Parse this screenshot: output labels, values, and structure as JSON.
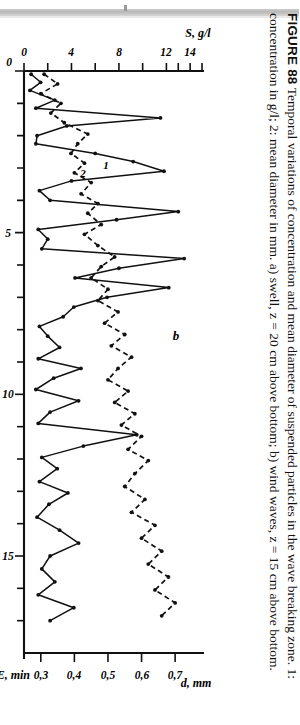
{
  "page": {
    "background": "#ffffff",
    "orientation": "rotated-90-cw",
    "artifact": "scan-edge-strip"
  },
  "figure": {
    "panel_label": "b",
    "series_label_1": "1",
    "series_label_2": "2"
  },
  "caption": {
    "number": "FIGURE 88",
    "text": "Temporal variations of concentration and mean diameter of suspended particles in the wave breaking zone. 1: concentration in g/l; 2: mean diameter in mm. a) swell, z = 20 cm above bottom; b) wind waves, z = 15 cm above bottom."
  },
  "chart_data": {
    "type": "line",
    "title": "",
    "xlabel": "TIME, min",
    "ylabel": "S, g/l",
    "y2label": "d, mm",
    "xlim": [
      0,
      18
    ],
    "ylim": [
      0,
      15
    ],
    "y2lim": [
      0.25,
      0.78
    ],
    "grid": false,
    "legend_position": "inline-annotations",
    "xticks": [
      0,
      5,
      10,
      15
    ],
    "xticklabels": [
      "0",
      "5",
      "10",
      "15"
    ],
    "xminorticks": [
      1,
      2,
      3,
      4,
      6,
      7,
      8,
      9,
      11,
      12,
      13,
      14,
      16,
      17
    ],
    "yticks": [
      0,
      4,
      8,
      12,
      14
    ],
    "yticklabels": [
      "0",
      "4",
      "8",
      "12",
      "14"
    ],
    "yminorticks": [
      2,
      6,
      10,
      13,
      15
    ],
    "y2ticks": [
      0.3,
      0.4,
      0.5,
      0.6,
      0.7
    ],
    "y2ticklabels": [
      "0,3",
      "0,4",
      "0,5",
      "0,6",
      "0,7"
    ],
    "series": [
      {
        "name": "1",
        "axis": "left",
        "style": "solid",
        "marker": "dot",
        "label": "concentration in g/l",
        "x": [
          0.1,
          0.35,
          0.6,
          0.9,
          1.15,
          1.45,
          1.7,
          2.0,
          2.25,
          2.55,
          2.8,
          3.1,
          3.4,
          3.7,
          4.0,
          4.35,
          4.6,
          4.9,
          5.2,
          5.5,
          5.8,
          6.1,
          6.4,
          6.7,
          7.0,
          7.3,
          7.6,
          7.9,
          8.2,
          8.55,
          8.9,
          9.2,
          9.5,
          9.85,
          10.2,
          10.55,
          10.9,
          11.25,
          11.6,
          11.95,
          12.3,
          12.7,
          13.05,
          13.4,
          13.8,
          14.2,
          14.6,
          15.0,
          15.4,
          15.8,
          16.2,
          16.6,
          17.0
        ],
        "y": [
          0.6,
          1.4,
          0.5,
          2.6,
          1.0,
          11.5,
          3.6,
          1.1,
          1.0,
          6.0,
          9.2,
          11.8,
          4.0,
          1.3,
          2.2,
          13.0,
          7.8,
          1.2,
          2.0,
          1.5,
          13.5,
          8.0,
          4.3,
          12.2,
          7.0,
          4.2,
          3.3,
          1.3,
          2.0,
          3.0,
          1.2,
          4.8,
          2.5,
          1.0,
          4.6,
          2.2,
          1.2,
          9.5,
          5.0,
          1.5,
          2.8,
          1.3,
          3.7,
          2.1,
          1.1,
          3.0,
          4.6,
          2.2,
          1.5,
          2.6,
          1.2,
          4.2,
          2.2
        ]
      },
      {
        "name": "2",
        "axis": "right",
        "style": "dashed",
        "marker": "dot",
        "label": "mean diameter in mm",
        "x": [
          0.1,
          0.4,
          0.7,
          1.0,
          1.3,
          1.6,
          1.95,
          2.25,
          2.55,
          2.85,
          3.15,
          3.45,
          3.8,
          4.1,
          4.4,
          4.75,
          5.05,
          5.4,
          5.75,
          6.05,
          6.4,
          6.75,
          7.1,
          7.45,
          7.8,
          8.15,
          8.5,
          8.85,
          9.2,
          9.55,
          9.9,
          10.25,
          10.6,
          10.95,
          11.3,
          11.7,
          12.05,
          12.45,
          12.85,
          13.25,
          13.65,
          14.05,
          14.45,
          14.85,
          15.25,
          15.65,
          16.05,
          16.45,
          16.85
        ],
        "y": [
          0.31,
          0.35,
          0.3,
          0.36,
          0.33,
          0.37,
          0.44,
          0.41,
          0.39,
          0.43,
          0.4,
          0.45,
          0.42,
          0.47,
          0.44,
          0.48,
          0.43,
          0.47,
          0.52,
          0.48,
          0.45,
          0.5,
          0.47,
          0.53,
          0.49,
          0.55,
          0.51,
          0.57,
          0.53,
          0.5,
          0.56,
          0.52,
          0.58,
          0.54,
          0.6,
          0.56,
          0.62,
          0.58,
          0.55,
          0.61,
          0.57,
          0.64,
          0.6,
          0.66,
          0.62,
          0.68,
          0.64,
          0.7,
          0.66
        ]
      }
    ]
  }
}
